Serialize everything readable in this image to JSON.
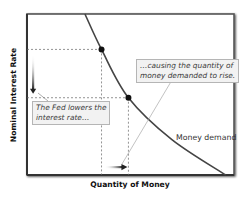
{
  "chart_data": {
    "type": "line",
    "title": "",
    "xlabel": "Quantity of Money",
    "ylabel": "Nominal Interest Rate",
    "axis_ticks": "none",
    "grid": false,
    "series": [
      {
        "name": "Money demand",
        "description": "downward-sloping convex curve",
        "points_normalized": [
          [
            0.28,
            1.0
          ],
          [
            0.36,
            0.78
          ],
          [
            0.49,
            0.48
          ],
          [
            0.7,
            0.22
          ],
          [
            0.96,
            0.0
          ]
        ]
      }
    ],
    "equilibria": [
      {
        "name": "initial",
        "x": 0.36,
        "y": 0.78
      },
      {
        "name": "new",
        "x": 0.49,
        "y": 0.48
      }
    ],
    "annotations": [
      {
        "id": "fed",
        "text_line1": "The Fed lowers the",
        "text_line2": "interest rate…"
      },
      {
        "id": "causing",
        "text_line1": "…causing the quantity of",
        "text_line2": "money demanded to rise."
      }
    ],
    "curve_label": "Money demand",
    "arrows": [
      {
        "name": "interest-rate-decrease",
        "direction": "down"
      },
      {
        "name": "quantity-increase",
        "direction": "right"
      }
    ]
  }
}
